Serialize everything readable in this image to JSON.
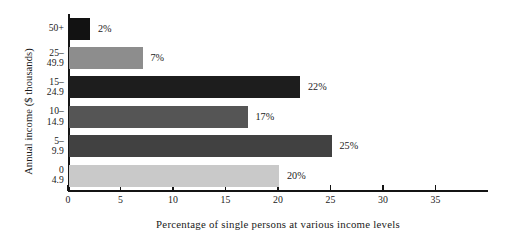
{
  "chart_data": {
    "type": "bar",
    "orientation": "horizontal",
    "title": "",
    "xlabel": "Percentage of single persons at various income levels",
    "ylabel": "Annual income ($ thousands)",
    "categories": [
      "50+",
      "25–49.9",
      "15–24.9",
      "10–14.9",
      "5–9.9",
      "0–4.9"
    ],
    "category_lines": [
      [
        "50+",
        ""
      ],
      [
        "25–",
        "49.9"
      ],
      [
        "15–",
        "24.9"
      ],
      [
        "10–",
        "14.9"
      ],
      [
        "5–",
        "9.9"
      ],
      [
        "0",
        "4.9"
      ]
    ],
    "values": [
      2,
      7,
      22,
      17,
      25,
      20
    ],
    "value_labels": [
      "2%",
      "7%",
      "22%",
      "17%",
      "25%",
      "20%"
    ],
    "bar_colors": [
      "#121212",
      "#8d8d8d",
      "#1d1d1d",
      "#555555",
      "#414141",
      "#c9c9c9"
    ],
    "xlim": [
      0,
      40
    ],
    "xticks": [
      0,
      5,
      10,
      15,
      20,
      25,
      30,
      35
    ],
    "xtick_labels": [
      "0",
      "5",
      "10",
      "15",
      "20",
      "25",
      "30",
      "35"
    ],
    "grid": false,
    "legend": "none",
    "axis_color": "#141414",
    "background": "#ffffff"
  }
}
